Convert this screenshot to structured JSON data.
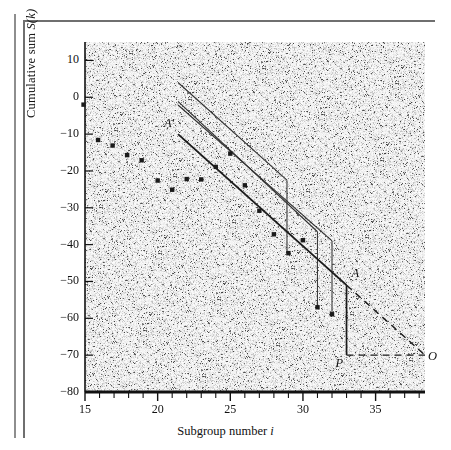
{
  "figure": {
    "axis_labels": {
      "x": "Subgroup number i",
      "x_main": "Subgroup number",
      "x_italic": "i",
      "y": "Cumulative sum S(k)",
      "y_main": "Cumulative sum",
      "y_italic": "S(k)"
    },
    "point_labels": {
      "a_prime": "A′",
      "a": "A",
      "p": "P",
      "o": "O"
    }
  },
  "chart_data": {
    "type": "scatter",
    "title": "",
    "subtitle": "",
    "xlabel": "Subgroup number i",
    "ylabel": "Cumulative sum S(k)",
    "xlim": [
      15,
      38.4
    ],
    "ylim": [
      -80,
      15
    ],
    "grid": false,
    "legend": null,
    "xticks": [
      15,
      20,
      25,
      30,
      35
    ],
    "xticks_minor": [
      16,
      17,
      18,
      19,
      21,
      22,
      23,
      24,
      26,
      27,
      28,
      29,
      31,
      32,
      33,
      34,
      36,
      37,
      38
    ],
    "yticks": [
      10,
      0,
      -10,
      -20,
      -30,
      -40,
      -50,
      -60,
      -70,
      -80
    ],
    "xtick_labels": [
      "15",
      "20",
      "25",
      "30",
      "35"
    ],
    "ytick_labels": [
      "10",
      "0",
      "−10",
      "−20",
      "−30",
      "−40",
      "−50",
      "−60",
      "−70",
      "−80"
    ],
    "series": [
      {
        "name": "Cumulative sum S(k)",
        "marker": "square",
        "color": "#1b1b1b",
        "points": [
          {
            "x": 14.9,
            "y": -2.0
          },
          {
            "x": 15.9,
            "y": -11.6
          },
          {
            "x": 16.9,
            "y": -13.1
          },
          {
            "x": 17.9,
            "y": -15.7
          },
          {
            "x": 18.9,
            "y": -17.1
          },
          {
            "x": 20.0,
            "y": -22.6
          },
          {
            "x": 21.0,
            "y": -25.1
          },
          {
            "x": 22.0,
            "y": -22.2
          },
          {
            "x": 23.0,
            "y": -22.3
          },
          {
            "x": 24.0,
            "y": -18.9
          },
          {
            "x": 25.0,
            "y": -15.3
          },
          {
            "x": 26.0,
            "y": -23.9
          },
          {
            "x": 27.0,
            "y": -30.8
          },
          {
            "x": 28.0,
            "y": -37.2
          },
          {
            "x": 29.0,
            "y": -42.3
          },
          {
            "x": 30.0,
            "y": -38.8
          },
          {
            "x": 31.0,
            "y": -57.0
          },
          {
            "x": 32.0,
            "y": -58.9
          }
        ]
      }
    ],
    "annotations": {
      "v_mask_slope": -5.45,
      "masks": [
        {
          "name": "mask-1",
          "label": "",
          "arm_from": {
            "x": 21.4,
            "y": 4.0
          },
          "arm_to": {
            "x": 28.9,
            "y": -22.5
          },
          "drop_to": {
            "x": 28.9,
            "y": -42.3
          },
          "datum": {
            "x": 28.9,
            "y": -42.3
          }
        },
        {
          "name": "mask-2",
          "label": "",
          "arm_from": {
            "x": 21.4,
            "y": -1.1
          },
          "arm_to": {
            "x": 31.0,
            "y": -36.5
          },
          "drop_to": {
            "x": 31.0,
            "y": -57.0
          },
          "datum": {
            "x": 31.0,
            "y": -57.0
          }
        },
        {
          "name": "mask-3",
          "label": "",
          "arm_from": {
            "x": 21.4,
            "y": -2.1
          },
          "arm_to": {
            "x": 32.0,
            "y": -39.0
          },
          "drop_to": {
            "x": 32.0,
            "y": -58.9
          },
          "datum": {
            "x": 32.0,
            "y": -58.9
          }
        },
        {
          "name": "mask-4-A-prime",
          "label": "A′",
          "arm_from": {
            "x": 21.4,
            "y": -10.0
          },
          "arm_to": {
            "x": 33.0,
            "y": -51.0
          },
          "drop_to": {
            "x": 33.0,
            "y": -70.0
          },
          "datum": {
            "x": 33.0,
            "y": -70.0
          }
        }
      ],
      "points": [
        {
          "label": "A",
          "x": 33.0,
          "y": -51.0
        },
        {
          "label": "P",
          "x": 33.0,
          "y": -70.0
        },
        {
          "label": "O",
          "x": 38.4,
          "y": -70.0
        }
      ],
      "dashed_segments": [
        {
          "from": {
            "x": 33.0,
            "y": -51.0
          },
          "to": {
            "x": 38.4,
            "y": -70.0
          }
        },
        {
          "from": {
            "x": 33.0,
            "y": -70.0
          },
          "to": {
            "x": 38.4,
            "y": -70.0
          }
        }
      ]
    }
  }
}
